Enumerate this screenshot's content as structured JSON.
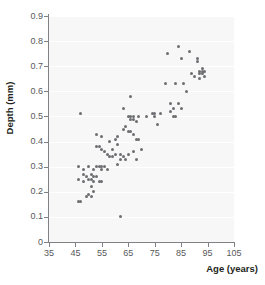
{
  "chart_data": {
    "type": "scatter",
    "title": "",
    "xlabel": "Age (years)",
    "ylabel": "Depth (mm)",
    "xlim": [
      35,
      105
    ],
    "ylim": [
      0,
      0.9
    ],
    "grid": true,
    "legend": null,
    "xticks": [
      "35",
      "45",
      "55",
      "65",
      "75",
      "85",
      "95",
      "105"
    ],
    "xtick_values": [
      35,
      45,
      55,
      65,
      75,
      85,
      95,
      105
    ],
    "yticks": [
      "0",
      "0.1",
      "0.2",
      "0.3",
      "0.4",
      "0.5",
      "0.6",
      "0.7",
      "0.8",
      "0.9"
    ],
    "ytick_values": [
      0,
      0.1,
      0.2,
      0.3,
      0.4,
      0.5,
      0.6,
      0.7,
      0.8,
      0.9
    ],
    "marker_color": "#6d6e71",
    "panel_color": "#f7f7f7",
    "series": [
      {
        "name": "Depth vs Age",
        "x": [
          46,
          46,
          46,
          47,
          47,
          48,
          48,
          48,
          49,
          49,
          50,
          50,
          50,
          51,
          51,
          51,
          51,
          52,
          52,
          52,
          52,
          53,
          53,
          53,
          53,
          54,
          54,
          54,
          55,
          55,
          55,
          55,
          55,
          56,
          56,
          57,
          57,
          58,
          58,
          59,
          59,
          60,
          60,
          61,
          61,
          61,
          62,
          62,
          62,
          63,
          63,
          63,
          64,
          64,
          65,
          65,
          65,
          66,
          66,
          66,
          66,
          67,
          67,
          67,
          67,
          68,
          68,
          68,
          69,
          69,
          70,
          72,
          74,
          75,
          75,
          76,
          77,
          79,
          80,
          81,
          81,
          82,
          82,
          83,
          83,
          84,
          84,
          85,
          85,
          86,
          87,
          88,
          89,
          90,
          91,
          91,
          92,
          92,
          92,
          93,
          93,
          93,
          94,
          94
        ],
        "y": [
          0.3,
          0.25,
          0.16,
          0.51,
          0.16,
          0.27,
          0.24,
          0.29,
          0.26,
          0.18,
          0.3,
          0.25,
          0.19,
          0.27,
          0.25,
          0.22,
          0.18,
          0.29,
          0.26,
          0.24,
          0.2,
          0.43,
          0.38,
          0.3,
          0.26,
          0.38,
          0.3,
          0.24,
          0.42,
          0.37,
          0.3,
          0.29,
          0.24,
          0.36,
          0.3,
          0.35,
          0.29,
          0.4,
          0.34,
          0.37,
          0.34,
          0.41,
          0.35,
          0.42,
          0.39,
          0.31,
          0.35,
          0.33,
          0.1,
          0.53,
          0.45,
          0.34,
          0.46,
          0.33,
          0.5,
          0.44,
          0.35,
          0.58,
          0.5,
          0.49,
          0.44,
          0.5,
          0.49,
          0.43,
          0.36,
          0.48,
          0.41,
          0.33,
          0.5,
          0.41,
          0.37,
          0.5,
          0.51,
          0.51,
          0.5,
          0.47,
          0.51,
          0.63,
          0.75,
          0.55,
          0.52,
          0.53,
          0.5,
          0.63,
          0.5,
          0.78,
          0.55,
          0.73,
          0.53,
          0.63,
          0.6,
          0.76,
          0.67,
          0.66,
          0.73,
          0.72,
          0.68,
          0.67,
          0.65,
          0.69,
          0.68,
          0.67,
          0.68,
          0.66
        ]
      }
    ]
  }
}
